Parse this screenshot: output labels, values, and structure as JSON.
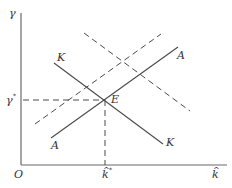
{
  "diagram": {
    "y_axis_label": "γ",
    "x_axis_label": "k",
    "x_axis_label_hat": "^",
    "origin_label": "O",
    "y_star_label": "γ",
    "y_star_sup": "*",
    "k_star_label": "k",
    "k_star_sup": "*",
    "k_star_hat": "^",
    "equilibrium_label": "E",
    "curves": [
      {
        "name": "KK",
        "style": "solid",
        "slope": "downward",
        "label_start": "K",
        "label_end": "K"
      },
      {
        "name": "AA",
        "style": "solid",
        "slope": "upward",
        "label_start": "A",
        "label_end": "A"
      },
      {
        "name": "AA-shifted",
        "style": "dashed",
        "slope": "upward"
      },
      {
        "name": "KK-shifted",
        "style": "dashed",
        "slope": "downward"
      }
    ]
  }
}
